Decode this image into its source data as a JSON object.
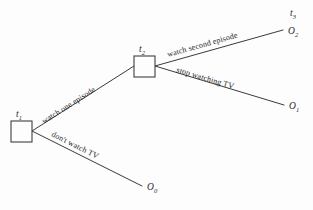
{
  "figure": {
    "type": "decision-tree",
    "background_color": "#fdfdfd",
    "line_color": "#3a3a3a",
    "text_color": "#262626"
  },
  "nodes": [
    {
      "id": "t1",
      "label": "t",
      "subscript": "1",
      "shape": "square",
      "x": 11,
      "y": 121,
      "size": 21,
      "label_x": 20,
      "label_y": 116
    },
    {
      "id": "t2",
      "label": "t",
      "subscript": "2",
      "shape": "square",
      "x": 134,
      "y": 56,
      "size": 21,
      "label_x": 143,
      "label_y": 51
    }
  ],
  "time_markers": [
    {
      "id": "t3",
      "label": "t",
      "subscript": "3",
      "x": 293,
      "y": 16
    }
  ],
  "outcomes": [
    {
      "id": "O2",
      "label": "O",
      "subscript": "2",
      "x": 288,
      "y": 34
    },
    {
      "id": "O1",
      "label": "O",
      "subscript": "1",
      "x": 289,
      "y": 109
    },
    {
      "id": "O0",
      "label": "O",
      "subscript": "0",
      "x": 147,
      "y": 190
    }
  ],
  "edges": [
    {
      "id": "edge-watch-one-episode",
      "from": "t1",
      "to": "t2",
      "label": "watch one episode",
      "x1": 32,
      "y1": 131,
      "x2": 134,
      "y2": 66,
      "label_x": 44,
      "label_y": 124,
      "rotation": -32.5
    },
    {
      "id": "edge-dont-watch-tv",
      "from": "t1",
      "to": "O0",
      "label": "don't watch TV",
      "x1": 32,
      "y1": 131,
      "x2": 142,
      "y2": 186,
      "label_x": 51,
      "label_y": 136,
      "rotation": 26.5
    },
    {
      "id": "edge-watch-second-episode",
      "from": "t2",
      "to": "O2",
      "label": "watch second episode",
      "x1": 155,
      "y1": 66,
      "x2": 283,
      "y2": 30,
      "label_x": 168,
      "label_y": 57,
      "rotation": -15.7
    },
    {
      "id": "edge-stop-watching-tv",
      "from": "t2",
      "to": "O1",
      "label": "stop watching TV",
      "x1": 155,
      "y1": 66,
      "x2": 284,
      "y2": 105,
      "label_x": 176,
      "label_y": 72,
      "rotation": 16.5
    }
  ]
}
